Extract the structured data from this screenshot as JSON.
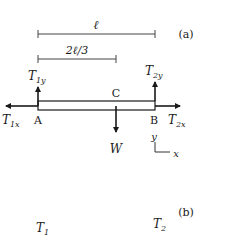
{
  "figure": {
    "panel_a_label": "(a)",
    "panel_b_label": "(b)"
  },
  "dimensions": {
    "full_length": "ℓ",
    "two_thirds_length": "2ℓ/3"
  },
  "points": {
    "A": "A",
    "B": "B",
    "C": "C"
  },
  "forces": {
    "T1y": {
      "main": "T",
      "sub": "1y"
    },
    "T2y": {
      "main": "T",
      "sub": "2y"
    },
    "T1x": {
      "main": "T",
      "sub": "1x"
    },
    "T2x": {
      "main": "T",
      "sub": "2x"
    },
    "W": {
      "main": "W"
    }
  },
  "axes": {
    "y": "y",
    "x": "x"
  },
  "panel_b": {
    "T1": {
      "main": "T",
      "sub": "1"
    },
    "T2": {
      "main": "T",
      "sub": "2"
    }
  },
  "colors": {
    "ink": "#1a1a1a",
    "dim_line": "#444444"
  }
}
